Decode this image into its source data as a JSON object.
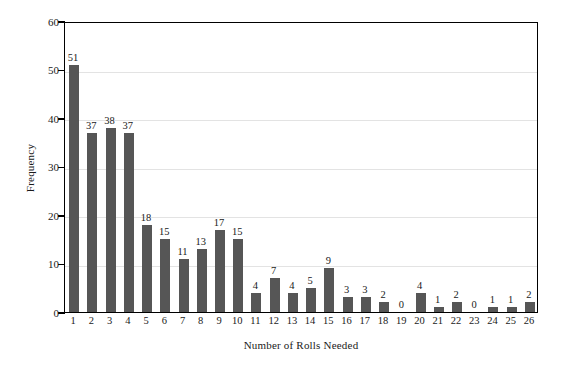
{
  "chart_data": {
    "type": "bar",
    "title": "",
    "xlabel": "Number of Rolls Needed",
    "ylabel": "Frequency",
    "categories": [
      "1",
      "2",
      "3",
      "4",
      "5",
      "6",
      "7",
      "8",
      "9",
      "10",
      "11",
      "12",
      "13",
      "14",
      "15",
      "16",
      "17",
      "18",
      "19",
      "20",
      "21",
      "22",
      "23",
      "24",
      "25",
      "26"
    ],
    "values": [
      51,
      37,
      38,
      37,
      18,
      15,
      11,
      13,
      17,
      15,
      4,
      7,
      4,
      5,
      9,
      3,
      3,
      2,
      0,
      4,
      1,
      2,
      0,
      1,
      1,
      2
    ],
    "data_labels": [
      "51",
      "37",
      "38",
      "37",
      "18",
      "15",
      "11",
      "13",
      "17",
      "15",
      "4",
      "7",
      "4",
      "5",
      "9",
      "3",
      "3",
      "2",
      "0",
      "4",
      "1",
      "2",
      "0",
      "1",
      "1",
      "2"
    ],
    "ylim": [
      0,
      60
    ],
    "yticks": [
      0,
      10,
      20,
      30,
      40,
      50,
      60
    ],
    "ytick_labels": [
      "0",
      "10",
      "20",
      "30",
      "40",
      "50",
      "60"
    ],
    "grid": true,
    "grid_axis": "y",
    "legend": null,
    "legend_position": "none",
    "bar_color": "#565656",
    "grid_color": "#e3e3e3",
    "axis_color": "#000000",
    "background_color": "#ffffff"
  }
}
